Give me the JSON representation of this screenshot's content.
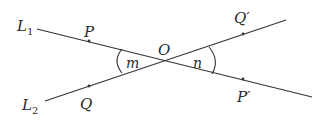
{
  "diagram": {
    "type": "intersecting-lines",
    "lines": [
      {
        "name": "L",
        "subscript": "1",
        "label_pos": [
          22,
          31
        ],
        "from": [
          37,
          29
        ],
        "to": [
          312,
          97
        ]
      },
      {
        "name": "L",
        "subscript": "2",
        "label_pos": [
          24,
          110
        ],
        "from": [
          45,
          101
        ],
        "to": [
          286,
          20
        ]
      }
    ],
    "intersection": {
      "label": "O",
      "pos": [
        167,
        60
      ]
    },
    "points": [
      {
        "label": "P",
        "dot": [
          89,
          41
        ],
        "label_pos": [
          85,
          37
        ]
      },
      {
        "label": "Q",
        "dot": [
          89,
          86
        ],
        "label_pos": [
          82,
          108
        ]
      },
      {
        "label": "Q′",
        "dot": [
          243,
          34
        ],
        "label_pos": [
          234,
          22
        ]
      },
      {
        "label": "P′",
        "dot": [
          243,
          79
        ],
        "label_pos": [
          238,
          101
        ]
      }
    ],
    "angles": [
      {
        "label": "m",
        "label_pos": [
          127,
          68
        ]
      },
      {
        "label": "n",
        "label_pos": [
          194,
          68
        ]
      }
    ],
    "line_color": "#333333"
  }
}
